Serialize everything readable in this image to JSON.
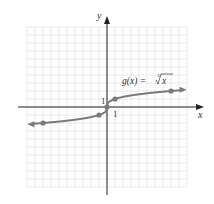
{
  "chart_data": {
    "type": "line",
    "title": "",
    "function_label": "g(x) = ∛x",
    "function_label_parts": {
      "name": "g(x) = ",
      "radical_index": "3",
      "radicand": "x"
    },
    "xlabel": "x",
    "ylabel": "y",
    "xlim": [
      -10,
      10
    ],
    "ylim": [
      -10,
      10
    ],
    "grid": true,
    "tick_labels": {
      "x": "1",
      "y": "1"
    },
    "series": [
      {
        "name": "g(x) = cube root of x",
        "x": [
          -8,
          -1,
          0,
          1,
          8
        ],
        "y": [
          -2,
          -1,
          0,
          1,
          2
        ],
        "marked_points": [
          [
            -8,
            -2
          ],
          [
            -1,
            -1
          ],
          [
            0,
            0
          ],
          [
            1,
            1
          ],
          [
            8,
            2
          ]
        ],
        "arrows": "both"
      }
    ],
    "colors": {
      "curve": "#7a7a7a",
      "grid": "#c8c8c8",
      "axes": "#222222"
    }
  }
}
